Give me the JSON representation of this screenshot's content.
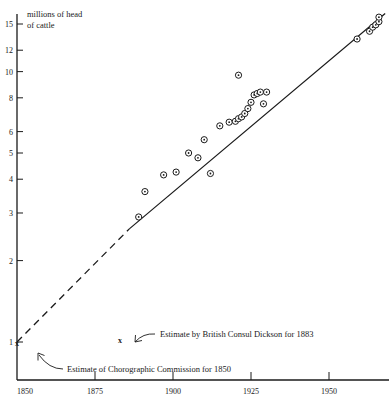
{
  "chart_data": {
    "type": "scatter",
    "title": "",
    "xlabel": "",
    "ylabel": "millions of head of cattle",
    "yscale": "log",
    "ylim": [
      1,
      16.5
    ],
    "xlim": [
      1850,
      1968
    ],
    "grid": false,
    "legend": "none",
    "xticks": [
      1850,
      1875,
      1900,
      1925,
      1950
    ],
    "xtick_labels": [
      "1850",
      "1875",
      "1900",
      "1925",
      "1950"
    ],
    "yticks": [
      1,
      2,
      3,
      4,
      5,
      6,
      8,
      10,
      12,
      15
    ],
    "ytick_labels": [
      "1",
      "2",
      "3",
      "4",
      "5",
      "6",
      "8",
      "10",
      "12",
      "15"
    ],
    "series": [
      {
        "name": "cattle observations",
        "marker": "circle-dot",
        "points": [
          {
            "x": 1889,
            "y": 2.9
          },
          {
            "x": 1891,
            "y": 3.6
          },
          {
            "x": 1897,
            "y": 4.15
          },
          {
            "x": 1901,
            "y": 4.25
          },
          {
            "x": 1905,
            "y": 5.0
          },
          {
            "x": 1908,
            "y": 4.8
          },
          {
            "x": 1910,
            "y": 5.6
          },
          {
            "x": 1912,
            "y": 4.2
          },
          {
            "x": 1915,
            "y": 6.3
          },
          {
            "x": 1918,
            "y": 6.5
          },
          {
            "x": 1920,
            "y": 6.55
          },
          {
            "x": 1921,
            "y": 6.7
          },
          {
            "x": 1922,
            "y": 6.8
          },
          {
            "x": 1923,
            "y": 7.0
          },
          {
            "x": 1924,
            "y": 7.3
          },
          {
            "x": 1925,
            "y": 7.7
          },
          {
            "x": 1926,
            "y": 8.2
          },
          {
            "x": 1927,
            "y": 8.3
          },
          {
            "x": 1928,
            "y": 8.4
          },
          {
            "x": 1929,
            "y": 7.6
          },
          {
            "x": 1930,
            "y": 8.4
          },
          {
            "x": 1921,
            "y": 9.7
          },
          {
            "x": 1959,
            "y": 13.2
          },
          {
            "x": 1963,
            "y": 14.1
          },
          {
            "x": 1964,
            "y": 14.6
          },
          {
            "x": 1965,
            "y": 14.9
          },
          {
            "x": 1966,
            "y": 15.3
          },
          {
            "x": 1966,
            "y": 15.9
          }
        ]
      }
    ],
    "trend_line": {
      "name": "fitted trend",
      "style_solid": {
        "x1": 1886,
        "y1": 2.62,
        "x2": 1968,
        "y2": 16.4
      },
      "style_dashed": {
        "x1": 1850,
        "y1": 1.0,
        "x2": 1886,
        "y2": 2.62
      }
    },
    "special_markers": [
      {
        "label": "x",
        "x": 1850,
        "y": 1.0,
        "name": "chorographic-commission-estimate"
      },
      {
        "label": "x",
        "x": 1883,
        "y": 1.02,
        "name": "dickson-estimate"
      }
    ],
    "annotations": [
      {
        "text": "millions of head",
        "name": "y-axis-title-line1"
      },
      {
        "text": "of cattle",
        "name": "y-axis-title-line2"
      },
      {
        "text": "Estimate by British Consul Dickson for 1883",
        "name": "annotation-dickson"
      },
      {
        "text": "Estimate of Chorographic Commission for 1850",
        "name": "annotation-chorographic"
      }
    ]
  },
  "colors": {
    "ink": "#1a1a1a",
    "background": "#ffffff",
    "marker": "#2b2b2b"
  }
}
